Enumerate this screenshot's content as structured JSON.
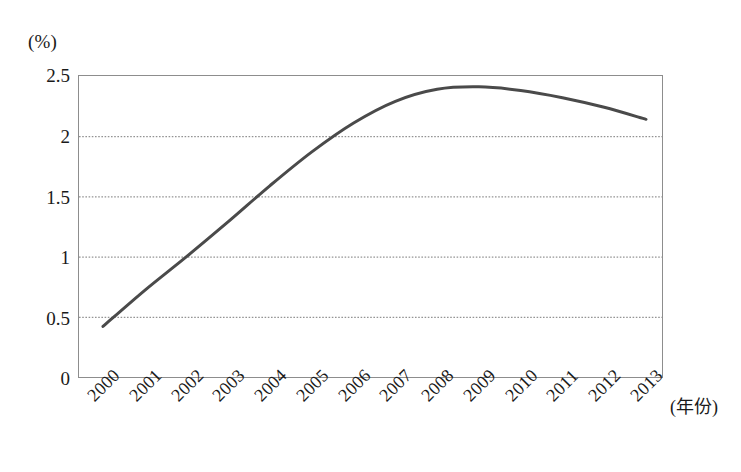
{
  "chart_data": {
    "type": "line",
    "title": "",
    "subtitle": "",
    "xlabel": "(年份)",
    "ylabel": "(%)",
    "unit_label": "(%)",
    "x": [
      2000,
      2001,
      2002,
      2003,
      2004,
      2005,
      2006,
      2007,
      2008,
      2009,
      2010,
      2011,
      2012,
      2013
    ],
    "categories": [
      "2000",
      "2001",
      "2002",
      "2003",
      "2004",
      "2005",
      "2006",
      "2007",
      "2008",
      "2009",
      "2010",
      "2011",
      "2012",
      "2013"
    ],
    "values": [
      0.42,
      0.72,
      1.0,
      1.29,
      1.59,
      1.87,
      2.11,
      2.29,
      2.39,
      2.41,
      2.38,
      2.32,
      2.24,
      2.14
    ],
    "series": [
      {
        "name": "",
        "values": [
          0.42,
          0.72,
          1.0,
          1.29,
          1.59,
          1.87,
          2.11,
          2.29,
          2.39,
          2.41,
          2.38,
          2.32,
          2.24,
          2.14
        ],
        "color": "#4a4a4a",
        "line_width": 3,
        "markers": false
      }
    ],
    "ylim": [
      0,
      2.5
    ],
    "xlim": [
      2000,
      2013
    ],
    "yticks": [
      0,
      0.5,
      1,
      1.5,
      2,
      2.5
    ],
    "ytick_labels": [
      "0",
      "0.5",
      "1",
      "1.5",
      "2",
      "2.5"
    ],
    "xtick_labels": [
      "2000",
      "2001",
      "2002",
      "2003",
      "2004",
      "2005",
      "2006",
      "2007",
      "2008",
      "2009",
      "2010",
      "2011",
      "2012",
      "2013"
    ],
    "grid": true,
    "grid_axis": "y",
    "grid_style": "dotted",
    "grid_color": "#7a7a7a",
    "legend": false,
    "legend_position": "none",
    "frame_color": "#8d8d8d",
    "background_color": "#ffffff",
    "annotations": []
  },
  "axes": {
    "y_unit": "(%)",
    "x_title": "(年份)",
    "y_tick_labels": [
      "2.5",
      "2",
      "1.5",
      "1",
      "0.5",
      "0"
    ],
    "x_tick_labels": [
      "2000",
      "2001",
      "2002",
      "2003",
      "2004",
      "2005",
      "2006",
      "2007",
      "2008",
      "2009",
      "2010",
      "2011",
      "2012",
      "2013"
    ]
  }
}
